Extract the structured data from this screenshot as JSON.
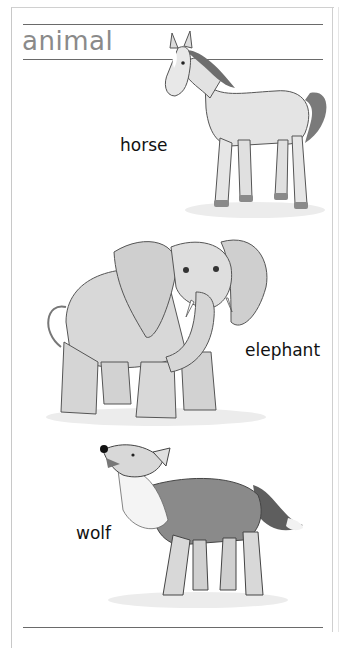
{
  "page": {
    "title": "animal",
    "accent_color": "#8a8a8a"
  },
  "animals": [
    {
      "name": "horse",
      "label": "horse"
    },
    {
      "name": "elephant",
      "label": "elephant"
    },
    {
      "name": "wolf",
      "label": "wolf"
    }
  ]
}
